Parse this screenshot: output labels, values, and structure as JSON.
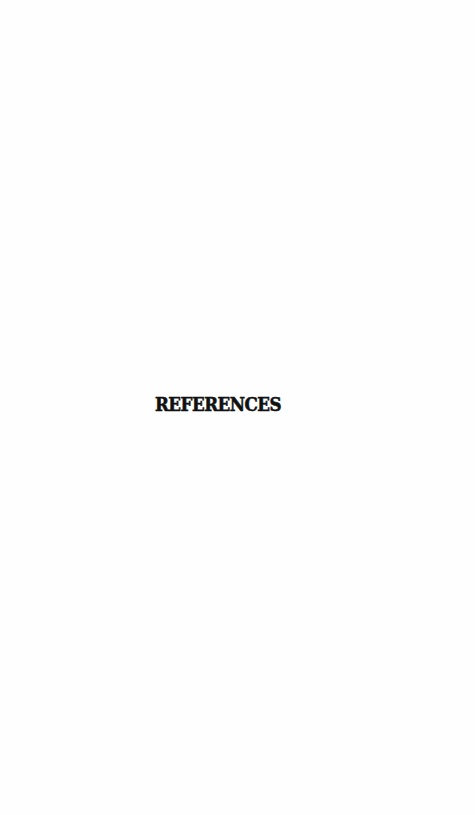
{
  "page": {
    "heading": "REFERENCES",
    "background_color": "#ffffff",
    "text_color": "#111111"
  }
}
